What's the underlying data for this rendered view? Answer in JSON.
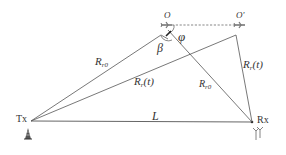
{
  "diagram": {
    "type": "bistatic-radar-geometry",
    "nodes": {
      "tx": {
        "label": "Tx",
        "x": 30,
        "y": 121
      },
      "rx": {
        "label": "Rx",
        "x": 253,
        "y": 122
      },
      "o": {
        "label": "O",
        "x": 168,
        "y": 25
      },
      "o_prime": {
        "label": "O'",
        "x": 240,
        "y": 25
      }
    },
    "edges": [
      {
        "from": "tx",
        "to": "rx",
        "label": "L"
      },
      {
        "from": "tx",
        "to": "o",
        "label_main": "R",
        "label_sub": "r0"
      },
      {
        "from": "o",
        "to": "rx",
        "label_main": "R",
        "label_sub": "r0"
      },
      {
        "from": "tx",
        "to": "o_prime",
        "label_main": "R",
        "label_sub": "r",
        "label_suffix": "(t)"
      },
      {
        "from": "o_prime",
        "to": "rx",
        "label_main": "R",
        "label_sub": "r",
        "label_suffix": "(t)"
      },
      {
        "from": "o",
        "to": "o_prime",
        "style": "dashed"
      }
    ],
    "angles": {
      "beta": "β",
      "phi": "φ"
    },
    "colors": {
      "line": "#555555",
      "text": "#333333",
      "background": "#ffffff"
    }
  }
}
